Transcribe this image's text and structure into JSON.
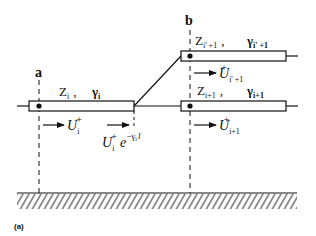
{
  "diagram": {
    "figure_label": "(a)",
    "nodes": {
      "a": {
        "label": "a"
      },
      "b": {
        "label": "b"
      }
    },
    "lines": {
      "line_i": {
        "impedance": "Z",
        "impedance_sub": "i",
        "separator": ",",
        "propagation": "γ",
        "propagation_sub": "i"
      },
      "line_i_prime_plus_1": {
        "impedance": "Z",
        "impedance_sub": "i' +1",
        "separator": ",",
        "propagation": "γ",
        "propagation_sub": "i' +1"
      },
      "line_i_plus_1": {
        "impedance": "Z",
        "impedance_sub": "i+1",
        "separator": ",",
        "propagation": "γ",
        "propagation_sub": "i+1"
      }
    },
    "waves": {
      "incident_i": {
        "symbol": "U",
        "sub": "i",
        "sup": "+"
      },
      "attenuated_i": {
        "symbol": "U",
        "sub": "i",
        "sup": "+",
        "factor": "e",
        "exponent": "−γ",
        "exponent_sub": "i",
        "exponent_tail": "l"
      },
      "transmitted_i_prime_plus_1": {
        "symbol": "U",
        "sub": "i' +1",
        "sup": "+"
      },
      "transmitted_i_plus_1": {
        "symbol": "U",
        "sub": "i+1",
        "sup": "+"
      }
    },
    "colors": {
      "ink": "#111111",
      "background": "#ffffff"
    }
  }
}
